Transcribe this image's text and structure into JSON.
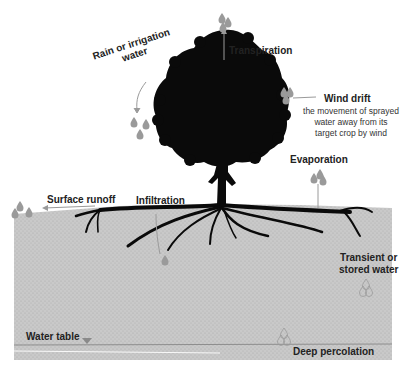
{
  "diagram": {
    "colors": {
      "soil": "#c8c8c8",
      "soil_dots": "#a9a9a9",
      "tree": "#0a0a0a",
      "droplet": "#9a9a9a",
      "arrow": "#999999",
      "water_table_line": "#8e8e8e"
    },
    "labels": {
      "rain": "Rain or irrigation water",
      "rain_line1": "Rain or irrigation",
      "rain_line2": "water",
      "transpiration": "Transpiration",
      "wind_drift": "Wind drift",
      "wind_drift_desc_1": "the movement of sprayed",
      "wind_drift_desc_2": "water away from its",
      "wind_drift_desc_3": "target crop by wind",
      "evaporation": "Evaporation",
      "surface_runoff": "Surface runoff",
      "infiltration": "Infiltration",
      "transient_1": "Transient or",
      "transient_2": "stored water",
      "water_table": "Water table",
      "deep_percolation": "Deep percolation"
    }
  }
}
